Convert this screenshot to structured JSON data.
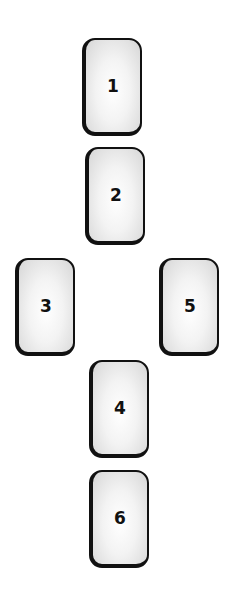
{
  "diagram": {
    "type": "card-spread-layout",
    "cards": [
      {
        "label": "1",
        "x": 82,
        "y": 38
      },
      {
        "label": "2",
        "x": 85,
        "y": 147
      },
      {
        "label": "3",
        "x": 15,
        "y": 258
      },
      {
        "label": "4",
        "x": 89,
        "y": 360
      },
      {
        "label": "5",
        "x": 159,
        "y": 258
      },
      {
        "label": "6",
        "x": 89,
        "y": 470
      }
    ]
  }
}
